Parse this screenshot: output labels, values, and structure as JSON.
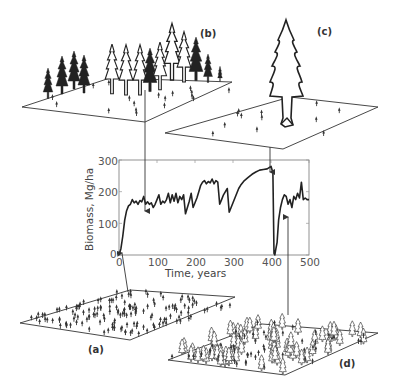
{
  "figure": {
    "panels": [
      {
        "id": "a",
        "label": "(a)",
        "description": "Many small seedlings evenly spread on a plot"
      },
      {
        "id": "b",
        "label": "(b)",
        "description": "Dense stand of many tall conifers"
      },
      {
        "id": "c",
        "label": "(c)",
        "description": "Single very large conifer with few seedlings"
      },
      {
        "id": "d",
        "label": "(d)",
        "description": "Regrowth of many young trees after disturbance"
      }
    ]
  },
  "chart_data": {
    "type": "line",
    "title": "",
    "xlabel": "Time, years",
    "ylabel": "Biomass, Mg/ha",
    "xlim": [
      0,
      500
    ],
    "ylim": [
      0,
      300
    ],
    "xticks": [
      "0",
      "100",
      "200",
      "300",
      "400",
      "500"
    ],
    "yticks": [
      "0",
      "100",
      "200",
      "300"
    ],
    "grid": false,
    "legend": null,
    "series": [
      {
        "name": "Biomass",
        "x": [
          0,
          5,
          10,
          15,
          20,
          25,
          30,
          35,
          40,
          45,
          50,
          55,
          60,
          65,
          70,
          75,
          80,
          85,
          90,
          95,
          100,
          105,
          110,
          115,
          120,
          125,
          130,
          135,
          140,
          145,
          150,
          155,
          160,
          165,
          170,
          175,
          180,
          185,
          190,
          195,
          200,
          205,
          210,
          215,
          220,
          225,
          230,
          235,
          240,
          245,
          250,
          255,
          260,
          265,
          270,
          275,
          280,
          285,
          290,
          295,
          300,
          305,
          310,
          315,
          320,
          330,
          340,
          350,
          360,
          370,
          380,
          390,
          400,
          405,
          408,
          410,
          413,
          416,
          420,
          425,
          430,
          435,
          440,
          445,
          450,
          455,
          460,
          465,
          470,
          475,
          480,
          485,
          490,
          495,
          500
        ],
        "values": [
          0,
          20,
          60,
          110,
          140,
          155,
          160,
          175,
          165,
          170,
          160,
          172,
          168,
          185,
          160,
          168,
          160,
          165,
          150,
          160,
          175,
          190,
          160,
          170,
          165,
          175,
          195,
          165,
          190,
          170,
          195,
          165,
          185,
          175,
          190,
          130,
          150,
          170,
          195,
          150,
          165,
          180,
          200,
          220,
          230,
          235,
          225,
          232,
          228,
          240,
          225,
          235,
          230,
          160,
          175,
          190,
          200,
          210,
          135,
          150,
          165,
          180,
          195,
          210,
          220,
          235,
          245,
          255,
          262,
          268,
          270,
          272,
          280,
          260,
          5,
          0,
          20,
          40,
          110,
          150,
          175,
          190,
          185,
          160,
          175,
          150,
          185,
          175,
          195,
          180,
          230,
          175,
          180,
          175,
          175
        ]
      }
    ],
    "annotations": [
      {
        "label": "(a)",
        "x": 5,
        "y": 0,
        "note": "arrow to initial seedling stage"
      },
      {
        "label": "(b)",
        "x": 65,
        "y": 180,
        "note": "arrow to dense stand"
      },
      {
        "label": "(c)",
        "x": 400,
        "y": 270,
        "note": "arrow to single large tree at peak"
      },
      {
        "label": "(d)",
        "x": 445,
        "y": 185,
        "note": "arrow to regrowth stage"
      }
    ]
  }
}
